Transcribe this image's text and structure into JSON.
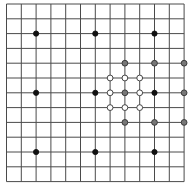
{
  "diagram": {
    "type": "grid-with-points",
    "grid": {
      "columns": 12,
      "rows": 12,
      "origin_x": 6.5,
      "origin_y": 4,
      "cell_width": 14.8,
      "cell_height": 14.8,
      "line_color": "#4a4a4a",
      "background": "#ffffff"
    },
    "point_styles": {
      "black": {
        "fill": "#111111",
        "stroke": "#111111",
        "radius": 2.6
      },
      "gray": {
        "fill": "#777777",
        "stroke": "#333333",
        "radius": 2.9
      },
      "white": {
        "fill": "#ffffff",
        "stroke": "#333333",
        "radius": 2.9
      }
    },
    "points": [
      {
        "col": 2,
        "row": 2,
        "style": "black"
      },
      {
        "col": 6,
        "row": 2,
        "style": "black"
      },
      {
        "col": 10,
        "row": 2,
        "style": "black"
      },
      {
        "col": 2,
        "row": 6,
        "style": "black"
      },
      {
        "col": 6,
        "row": 6,
        "style": "black"
      },
      {
        "col": 10,
        "row": 6,
        "style": "black"
      },
      {
        "col": 2,
        "row": 10,
        "style": "black"
      },
      {
        "col": 6,
        "row": 10,
        "style": "black"
      },
      {
        "col": 10,
        "row": 10,
        "style": "black"
      },
      {
        "col": 8,
        "row": 4,
        "style": "gray"
      },
      {
        "col": 10,
        "row": 4,
        "style": "gray"
      },
      {
        "col": 12,
        "row": 4,
        "style": "gray"
      },
      {
        "col": 8,
        "row": 6,
        "style": "gray"
      },
      {
        "col": 12,
        "row": 6,
        "style": "gray"
      },
      {
        "col": 8,
        "row": 8,
        "style": "gray"
      },
      {
        "col": 10,
        "row": 8,
        "style": "gray"
      },
      {
        "col": 12,
        "row": 8,
        "style": "gray"
      },
      {
        "col": 7,
        "row": 5,
        "style": "white"
      },
      {
        "col": 8,
        "row": 5,
        "style": "white"
      },
      {
        "col": 9,
        "row": 5,
        "style": "white"
      },
      {
        "col": 7,
        "row": 6,
        "style": "white"
      },
      {
        "col": 9,
        "row": 6,
        "style": "white"
      },
      {
        "col": 7,
        "row": 7,
        "style": "white"
      },
      {
        "col": 8,
        "row": 7,
        "style": "white"
      },
      {
        "col": 9,
        "row": 7,
        "style": "white"
      }
    ]
  }
}
